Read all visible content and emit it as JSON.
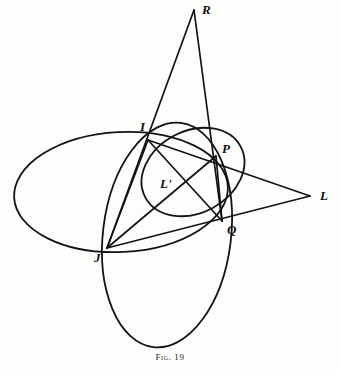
{
  "figure": {
    "caption_prefix": "Fig.",
    "caption_number": "19",
    "caption_full": "Fig. 19",
    "ink_color": "#131313",
    "background_color": "#fdfdfb"
  },
  "points": [
    {
      "id": "R",
      "label": "R",
      "x": 194,
      "y": 10,
      "label_x": 202,
      "label_y": 14
    },
    {
      "id": "I",
      "label": "I",
      "x": 148,
      "y": 140,
      "label_x": 140,
      "label_y": 131
    },
    {
      "id": "P",
      "label": "P",
      "x": 216,
      "y": 156,
      "label_x": 222,
      "label_y": 153
    },
    {
      "id": "L",
      "label": "L",
      "x": 310,
      "y": 196,
      "label_x": 320,
      "label_y": 200
    },
    {
      "id": "Lp",
      "label": "L'",
      "x": 180,
      "y": 180,
      "label_x": 160,
      "label_y": 188
    },
    {
      "id": "Q",
      "label": "Q",
      "x": 222,
      "y": 221,
      "label_x": 227,
      "label_y": 234
    },
    {
      "id": "J",
      "label": "J",
      "x": 107,
      "y": 248,
      "label_x": 94,
      "label_y": 262
    }
  ],
  "conics": [
    {
      "name": "horizontal-ellipse",
      "cx": 121,
      "cy": 192,
      "rx": 107,
      "ry": 60,
      "rotation": -3,
      "stroke_width": 1.8
    },
    {
      "name": "vertical-ellipse",
      "cx": 167,
      "cy": 235,
      "rx": 64,
      "ry": 113,
      "rotation": 7,
      "stroke_width": 1.8
    },
    {
      "name": "small-ellipse",
      "cx": 193,
      "cy": 172,
      "rx": 41,
      "ry": 54,
      "rotation": 62,
      "stroke_width": 1.8
    }
  ],
  "chords": [
    {
      "name": "R-to-J",
      "x1": 194,
      "y1": 10,
      "x2": 107,
      "y2": 248,
      "stroke_width": 1.7
    },
    {
      "name": "R-to-Q",
      "x1": 194,
      "y1": 10,
      "x2": 222,
      "y2": 221,
      "stroke_width": 1.7
    },
    {
      "name": "I-to-L",
      "x1": 148,
      "y1": 140,
      "x2": 310,
      "y2": 196,
      "stroke_width": 1.7
    },
    {
      "name": "J-to-L",
      "x1": 107,
      "y1": 248,
      "x2": 310,
      "y2": 196,
      "stroke_width": 1.7
    },
    {
      "name": "I-to-Q",
      "x1": 148,
      "y1": 140,
      "x2": 222,
      "y2": 221,
      "stroke_width": 1.7
    },
    {
      "name": "J-to-P",
      "x1": 107,
      "y1": 248,
      "x2": 216,
      "y2": 156,
      "stroke_width": 1.7
    },
    {
      "name": "I-to-J",
      "x1": 148,
      "y1": 140,
      "x2": 107,
      "y2": 248,
      "stroke_width": 1.7
    },
    {
      "name": "P-to-Q",
      "x1": 216,
      "y1": 156,
      "x2": 222,
      "y2": 221,
      "stroke_width": 1.7
    }
  ],
  "chart_data": {
    "type": "diagram",
    "title": "Fig. 19",
    "labeled_points": [
      "R",
      "I",
      "P",
      "L",
      "L'",
      "Q",
      "J"
    ],
    "conic_count": 3,
    "chord_count": 8
  }
}
